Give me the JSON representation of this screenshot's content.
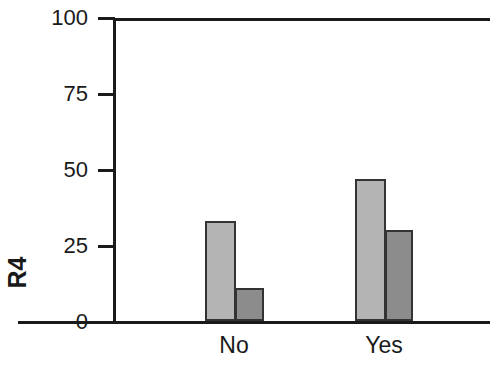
{
  "chart_data": {
    "type": "bar",
    "title": "",
    "xlabel": "",
    "ylabel": "R4",
    "categories": [
      "No",
      "Yes"
    ],
    "series": [
      {
        "name": "series-1",
        "color": "#b4b4b4",
        "values": [
          33,
          47
        ]
      },
      {
        "name": "series-2",
        "color": "#8c8c8c",
        "values": [
          11,
          30
        ]
      }
    ],
    "ylim": [
      0,
      100
    ],
    "yticks": [
      0,
      25,
      50,
      75,
      100
    ],
    "ytick_labels": [
      "0",
      "25",
      "50",
      "75",
      "100"
    ],
    "grid": false,
    "legend": "none",
    "bar_edge_color": "#333333",
    "axis_color": "#1a1a1a"
  },
  "axis": {
    "y_label": "R4",
    "ticks": [
      {
        "label": "100",
        "value": 100
      },
      {
        "label": "75",
        "value": 75
      },
      {
        "label": "50",
        "value": 50
      },
      {
        "label": "25",
        "value": 25
      },
      {
        "label": "0",
        "value": 0
      }
    ],
    "categories": [
      {
        "label": "No"
      },
      {
        "label": "Yes"
      }
    ]
  }
}
